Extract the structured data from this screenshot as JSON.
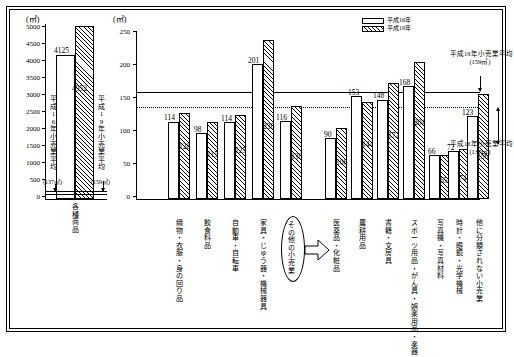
{
  "units": {
    "axis_unit": "(㎡)"
  },
  "legend": {
    "items": [
      {
        "label": "平成16年",
        "pattern": "white"
      },
      {
        "label": "平成19年",
        "pattern": "hatched"
      }
    ]
  },
  "left_chart": {
    "y_ticks": [
      "5000",
      "4500",
      "4000",
      "3500",
      "3000",
      "2500",
      "2000",
      "1500",
      "1000",
      "500",
      "0"
    ],
    "y_max": 5000,
    "unit": "(㎡)",
    "category": "各種商品",
    "bars": [
      {
        "series": "平成16年",
        "value": 4125,
        "label": "4125"
      },
      {
        "series": "平成19年",
        "value": 4952,
        "label": "4952"
      }
    ],
    "annotation_left": {
      "text": "平成16年小売業平均",
      "value": "(137㎡)",
      "line_value": 137
    },
    "annotation_right": {
      "text": "平成19年小売業平均",
      "value": "(159㎡)",
      "line_value": 159
    }
  },
  "chart_data": {
    "type": "bar",
    "title": "",
    "xlabel": "",
    "ylabel": "",
    "unit": "㎡",
    "ylim": [
      0,
      250
    ],
    "y_ticks": [
      0,
      50,
      100,
      150,
      200,
      250
    ],
    "y_tick_labels": [
      "0",
      "50",
      "100",
      "150",
      "200",
      "250"
    ],
    "grid": false,
    "legend_position": "top-right",
    "categories": [
      "織物・衣服・身の回り品",
      "飲食料品",
      "自動車・自転車",
      "家具・じゅう器・機械器具",
      "その他の小売業",
      "医薬品・化粧品",
      "農耕用品",
      "書籍・文房具",
      "スポーツ用品・がん具・娯楽用品・楽器",
      "写真機・写真材料",
      "時計・眼鏡・光学機械",
      "他に分類されない小売業"
    ],
    "series": [
      {
        "name": "平成16年",
        "values": [
          114,
          98,
          114,
          201,
          116,
          90,
          153,
          148,
          168,
          66,
          72,
          123
        ]
      },
      {
        "name": "平成19年",
        "values": [
          128,
          115,
          125,
          236,
          138,
          106,
          144,
          172,
          204,
          65,
          74,
          156
        ]
      }
    ],
    "reference_lines": [
      {
        "label": "平成19年小売業平均",
        "value": 159,
        "value_label": "(159㎡)",
        "style": "solid"
      },
      {
        "label": "平成16年小売業平均",
        "value": 137,
        "value_label": "(137㎡)",
        "style": "dotted"
      }
    ],
    "annotations": [
      {
        "text": "その他の小売業",
        "kind": "circled-category"
      }
    ]
  }
}
